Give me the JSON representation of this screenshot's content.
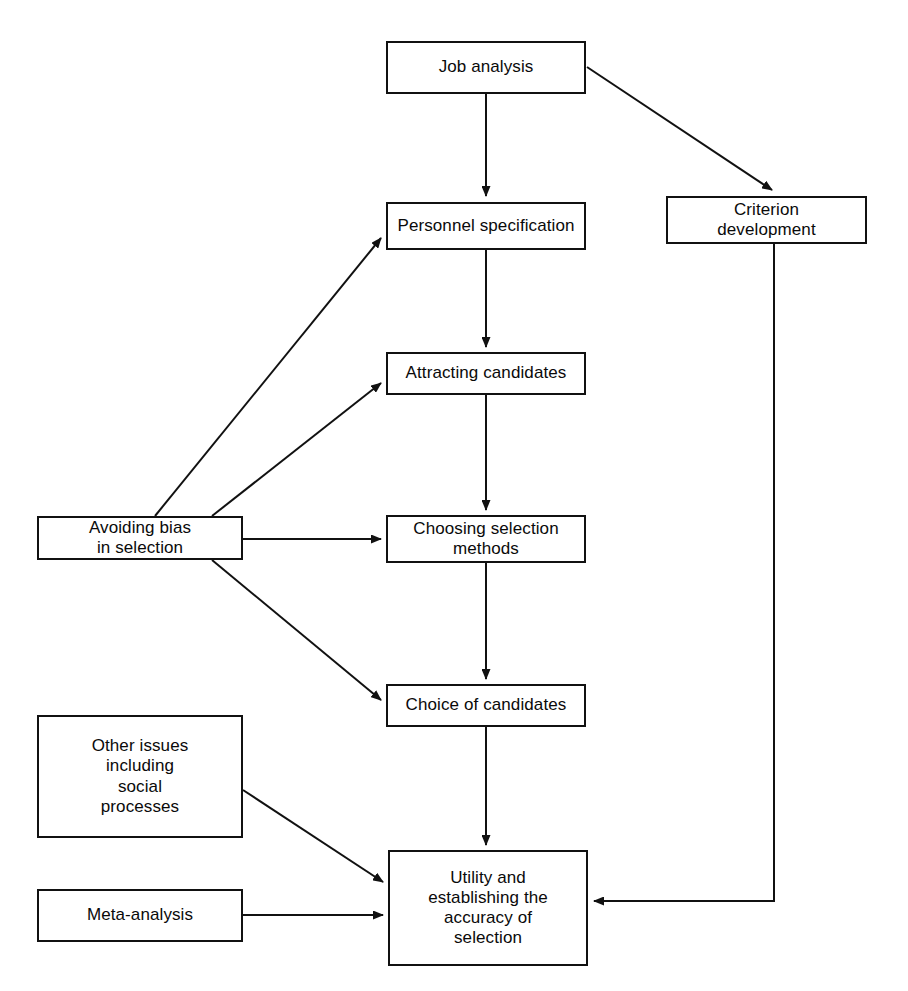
{
  "diagram": {
    "type": "flowchart",
    "background_color": "#ffffff",
    "line_color": "#111111",
    "text_color": "#0a0a0a",
    "nodes": [
      {
        "id": "job_analysis",
        "label": "Job analysis"
      },
      {
        "id": "criterion_development",
        "label": "Criterion\ndevelopment"
      },
      {
        "id": "personnel_specification",
        "label": "Personnel specification"
      },
      {
        "id": "attracting_candidates",
        "label": "Attracting candidates"
      },
      {
        "id": "choosing_selection",
        "label": "Choosing selection\nmethods"
      },
      {
        "id": "choice_of_candidates",
        "label": "Choice of candidates"
      },
      {
        "id": "avoiding_bias",
        "label": "Avoiding bias\nin selection"
      },
      {
        "id": "other_issues",
        "label": "Other issues\nincluding\nsocial\nprocesses"
      },
      {
        "id": "meta_analysis",
        "label": "Meta-analysis"
      },
      {
        "id": "utility",
        "label": "Utility and\nestablishing the\naccuracy of\nselection"
      }
    ],
    "edges": [
      {
        "from": "job_analysis",
        "to": "personnel_specification",
        "style": "straight-arrow"
      },
      {
        "from": "job_analysis",
        "to": "criterion_development",
        "style": "diagonal-arrow"
      },
      {
        "from": "personnel_specification",
        "to": "attracting_candidates",
        "style": "straight-arrow"
      },
      {
        "from": "attracting_candidates",
        "to": "choosing_selection",
        "style": "straight-arrow"
      },
      {
        "from": "choosing_selection",
        "to": "choice_of_candidates",
        "style": "straight-arrow"
      },
      {
        "from": "choice_of_candidates",
        "to": "utility",
        "style": "straight-arrow"
      },
      {
        "from": "avoiding_bias",
        "to": "personnel_specification",
        "style": "diagonal-arrow"
      },
      {
        "from": "avoiding_bias",
        "to": "attracting_candidates",
        "style": "diagonal-arrow"
      },
      {
        "from": "avoiding_bias",
        "to": "choosing_selection",
        "style": "straight-arrow"
      },
      {
        "from": "avoiding_bias",
        "to": "choice_of_candidates",
        "style": "diagonal-arrow"
      },
      {
        "from": "other_issues",
        "to": "utility",
        "style": "diagonal-arrow"
      },
      {
        "from": "meta_analysis",
        "to": "utility",
        "style": "straight-arrow"
      },
      {
        "from": "criterion_development",
        "to": "utility",
        "style": "elbow-arrow"
      }
    ]
  },
  "labels": {
    "job_analysis": "Job analysis",
    "criterion_development": "Criterion\ndevelopment",
    "personnel_specification": "Personnel specification",
    "attracting_candidates": "Attracting candidates",
    "choosing_selection": "Choosing selection\nmethods",
    "choice_of_candidates": "Choice of candidates",
    "avoiding_bias": "Avoiding bias\nin selection",
    "other_issues": "Other issues\nincluding\nsocial\nprocesses",
    "meta_analysis": "Meta-analysis",
    "utility": "Utility and\nestablishing the\naccuracy of\nselection"
  }
}
